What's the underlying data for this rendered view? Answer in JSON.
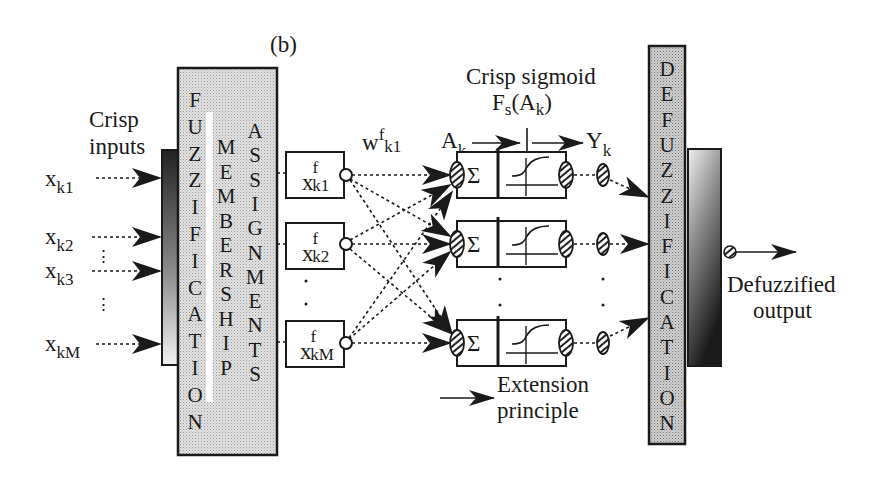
{
  "figure": {
    "panel_label": "(b)",
    "colors": {
      "ink": "#1a1a1a",
      "block_fill": "#d9d9d9",
      "gradient_dark": "#222222",
      "gradient_light": "#f0f0f0"
    }
  },
  "inputs": {
    "title_line1": "Crisp",
    "title_line2": "inputs",
    "items": [
      {
        "base": "x",
        "sub": "k1"
      },
      {
        "base": "x",
        "sub": "k2"
      },
      {
        "base": "x",
        "sub": "k3"
      },
      {
        "base": "x",
        "sub": "kM"
      }
    ],
    "ellipsis": "⋮"
  },
  "fuzzification": {
    "col1": [
      "F",
      "U",
      "Z",
      "Z",
      "I",
      "F",
      "I",
      "C",
      "A",
      "T",
      "I",
      "O",
      "N"
    ],
    "col2": [
      "M",
      "E",
      "M",
      "B",
      "E",
      "R",
      "S",
      "H",
      "I",
      "P"
    ],
    "col3": [
      "A",
      "S",
      "S",
      "I",
      "G",
      "N",
      "M",
      "E",
      "N",
      "T",
      "S"
    ]
  },
  "fuzzy_nodes": [
    {
      "base": "x",
      "sup": "f",
      "sub": "k1"
    },
    {
      "base": "x",
      "sup": "f",
      "sub": "k2"
    },
    {
      "base": "x",
      "sup": "f",
      "sub": "kM"
    }
  ],
  "weights": {
    "base": "w",
    "sup": "f",
    "sub": "k1"
  },
  "neurons": {
    "input_label": {
      "base": "A",
      "sub": "k"
    },
    "output_label": {
      "base": "Y",
      "sub": "k"
    },
    "sigmoid_title": "Crisp sigmoid",
    "sigmoid_func": {
      "base": "F",
      "sub": "s",
      "arg_base": "A",
      "arg_sub": "k"
    },
    "sum_symbol": "Σ",
    "count_visible": 3
  },
  "legend": {
    "line1": "Extension",
    "line2": "principle"
  },
  "defuzzification": {
    "letters": [
      "D",
      "E",
      "F",
      "U",
      "Z",
      "Z",
      "I",
      "F",
      "I",
      "C",
      "A",
      "T",
      "I",
      "O",
      "N"
    ]
  },
  "output": {
    "line1": "Defuzzified",
    "line2": "output"
  }
}
